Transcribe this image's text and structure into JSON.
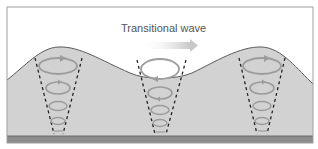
{
  "diagram": {
    "title": "Transitional wave",
    "colors": {
      "water": "#d2d2d2",
      "air": "#ffffff",
      "surface_line": "#5a5a5a",
      "seabed": "#8c8c8c",
      "frame": "#9a9a9a",
      "orbit": "#9c9c9c",
      "orbit_highlight": "#ffffff",
      "dash": "#222222",
      "arrow": "#d8d8d8"
    },
    "columns": [
      {
        "name": "crest-left",
        "x": 58,
        "position": "crest"
      },
      {
        "name": "trough-center",
        "x": 160,
        "position": "trough"
      },
      {
        "name": "crest-right",
        "x": 262,
        "position": "crest"
      }
    ],
    "direction_arrow": {
      "label": "direction of propagation",
      "direction": "right"
    }
  }
}
